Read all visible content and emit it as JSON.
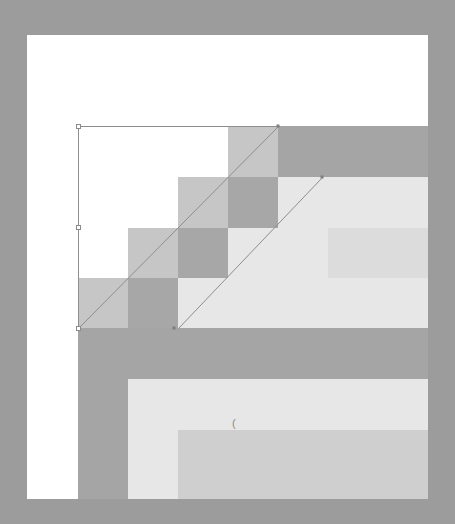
{
  "canvas": {
    "background": "#ffffff",
    "frame_color": "#9c9c9c"
  },
  "colors": {
    "white": "#ffffff",
    "step_light": "#c6c6c6",
    "step_dark": "#a7a7a7",
    "band_dark": "#a5a5a5",
    "fill_very_light": "#e7e7e7",
    "fill_light": "#dcdcdc",
    "fill_medium": "#cfcfcf",
    "line": "#8e8e8e"
  },
  "grid": {
    "columns": [
      78,
      128,
      178,
      228,
      278,
      328,
      378,
      428
    ],
    "rows": [
      126,
      177,
      228,
      278,
      328,
      379,
      430,
      499
    ]
  },
  "cells": [
    {
      "x": 228,
      "y": 126,
      "w": 50,
      "h": 51,
      "color": "step_light"
    },
    {
      "x": 278,
      "y": 126,
      "w": 150,
      "h": 51,
      "color": "band_dark"
    },
    {
      "x": 178,
      "y": 177,
      "w": 50,
      "h": 51,
      "color": "step_light"
    },
    {
      "x": 228,
      "y": 177,
      "w": 50,
      "h": 51,
      "color": "step_dark"
    },
    {
      "x": 278,
      "y": 177,
      "w": 150,
      "h": 51,
      "color": "fill_very_light"
    },
    {
      "x": 128,
      "y": 228,
      "w": 50,
      "h": 50,
      "color": "step_light"
    },
    {
      "x": 178,
      "y": 228,
      "w": 50,
      "h": 50,
      "color": "step_dark"
    },
    {
      "x": 228,
      "y": 228,
      "w": 100,
      "h": 50,
      "color": "fill_very_light"
    },
    {
      "x": 328,
      "y": 228,
      "w": 100,
      "h": 50,
      "color": "fill_light"
    },
    {
      "x": 78,
      "y": 278,
      "w": 50,
      "h": 50,
      "color": "step_light"
    },
    {
      "x": 128,
      "y": 278,
      "w": 50,
      "h": 50,
      "color": "step_dark"
    },
    {
      "x": 178,
      "y": 278,
      "w": 250,
      "h": 50,
      "color": "fill_very_light"
    },
    {
      "x": 78,
      "y": 328,
      "w": 350,
      "h": 51,
      "color": "band_dark"
    },
    {
      "x": 78,
      "y": 379,
      "w": 50,
      "h": 51,
      "color": "band_dark"
    },
    {
      "x": 128,
      "y": 379,
      "w": 300,
      "h": 51,
      "color": "fill_very_light"
    },
    {
      "x": 78,
      "y": 430,
      "w": 50,
      "h": 69,
      "color": "band_dark"
    },
    {
      "x": 128,
      "y": 430,
      "w": 50,
      "h": 69,
      "color": "fill_very_light"
    },
    {
      "x": 178,
      "y": 430,
      "w": 250,
      "h": 69,
      "color": "fill_medium"
    }
  ],
  "selection": {
    "top_edge": {
      "x1": 78,
      "y1": 126,
      "x2": 278,
      "y2": 126
    },
    "left_edge": {
      "x1": 78,
      "y1": 126,
      "x2": 78,
      "y2": 328
    },
    "handles": [
      {
        "x": 78,
        "y": 126
      },
      {
        "x": 78,
        "y": 227
      },
      {
        "x": 78,
        "y": 328
      }
    ]
  },
  "diagonals": [
    {
      "x1": 78,
      "y1": 328,
      "x2": 278,
      "y2": 126
    },
    {
      "x1": 178,
      "y1": 328,
      "x2": 322,
      "y2": 177
    }
  ],
  "anchor_points": [
    {
      "x": 278,
      "y": 126
    },
    {
      "x": 322,
      "y": 177
    },
    {
      "x": 174,
      "y": 328
    }
  ],
  "cursor_glyph": {
    "text": "(",
    "x": 232,
    "y": 418
  }
}
